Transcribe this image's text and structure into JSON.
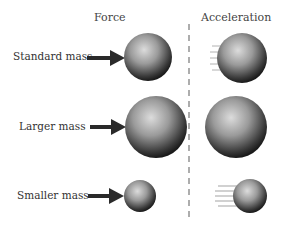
{
  "headers": {
    "force": "Force",
    "acceleration": "Acceleration"
  },
  "rows": [
    {
      "label": "Standard mass",
      "force_sphere": {
        "cx": 148,
        "cy": 57,
        "r": 24
      },
      "accel_sphere": {
        "cx": 242,
        "cy": 58,
        "r": 25
      },
      "motion_blur": "short"
    },
    {
      "label": "Larger mass",
      "force_sphere": {
        "cx": 156,
        "cy": 127,
        "r": 31
      },
      "accel_sphere": {
        "cx": 236,
        "cy": 127,
        "r": 31
      },
      "motion_blur": "none"
    },
    {
      "label": "Smaller mass",
      "force_sphere": {
        "cx": 140,
        "cy": 196,
        "r": 16
      },
      "accel_sphere": {
        "cx": 250,
        "cy": 196,
        "r": 17
      },
      "motion_blur": "long"
    }
  ],
  "colors": {
    "sphere_light": "#d8d8d8",
    "sphere_dark": "#1a1a1a",
    "arrow": "#2a2a2a",
    "divider": "#777777"
  }
}
